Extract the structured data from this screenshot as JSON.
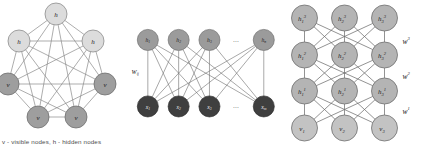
{
  "figure": {
    "caption": "v - visible nodes, h - hidden nodes"
  },
  "colors": {
    "hidden_light": "#dcdcdc",
    "visible_mid": "#9e9e9e",
    "rbm_hidden": "#9b9b9b",
    "rbm_visible": "#3f3f3f",
    "dbn_node": "#b4b4b4",
    "edge": "#8a8a8a",
    "background": "#ffffff",
    "text": "#1b1b1b"
  },
  "panels": {
    "boltzmann_machine": {
      "name": "boltzmann-machine",
      "nodes": [
        {
          "id": "h-top",
          "label": "h",
          "type": "hidden",
          "cx": 56,
          "cy": 14,
          "r": 11
        },
        {
          "id": "h-upper-left",
          "label": "h",
          "type": "hidden",
          "cx": 19,
          "cy": 41,
          "r": 11
        },
        {
          "id": "h-upper-right",
          "label": "h",
          "type": "hidden",
          "cx": 93,
          "cy": 41,
          "r": 11
        },
        {
          "id": "v-left",
          "label": "v",
          "type": "visible",
          "cx": 8,
          "cy": 84,
          "r": 11
        },
        {
          "id": "v-right",
          "label": "v",
          "type": "visible",
          "cx": 105,
          "cy": 84,
          "r": 11
        },
        {
          "id": "v-bottom-left",
          "label": "v",
          "type": "visible",
          "cx": 38,
          "cy": 117,
          "r": 11
        },
        {
          "id": "v-bottom-right",
          "label": "v",
          "type": "visible",
          "cx": 76,
          "cy": 117,
          "r": 11
        }
      ],
      "fully_connected": true,
      "edge_count": 21
    },
    "restricted_boltzmann_machine": {
      "name": "restricted-boltzmann-machine",
      "weight_label": "W",
      "weight_sub": "ij",
      "hidden_layer": {
        "labels": [
          "h",
          "h",
          "h",
          "h"
        ],
        "subs": [
          "1",
          "2",
          "3",
          "n"
        ],
        "ellipsis": "...",
        "cx": [
          22,
          60,
          98,
          165
        ],
        "cy": 32,
        "r": 13,
        "ellipsis_x": 131,
        "ellipsis_y": 32
      },
      "visible_layer": {
        "labels": [
          "x",
          "x",
          "x",
          "x"
        ],
        "subs": [
          "1",
          "2",
          "3",
          "m"
        ],
        "ellipsis": "...",
        "cx": [
          22,
          60,
          98,
          165
        ],
        "cy": 114,
        "r": 13,
        "ellipsis_x": 131,
        "ellipsis_y": 114
      }
    },
    "deep_belief_network": {
      "name": "deep-belief-network",
      "weights": [
        {
          "label": "w",
          "sup": "3",
          "x": 120,
          "y": 41
        },
        {
          "label": "w",
          "sup": "2",
          "x": 120,
          "y": 76
        },
        {
          "label": "w",
          "sup": "1",
          "x": 120,
          "y": 111
        }
      ],
      "layers": [
        {
          "id": "layer-h3",
          "cy": 18,
          "nodes": [
            {
              "label": "h",
              "sub": "1",
              "sup": "3",
              "cx": 22
            },
            {
              "label": "h",
              "sub": "2",
              "sup": "3",
              "cx": 62
            },
            {
              "label": "h",
              "sub": "3",
              "sup": "3",
              "cx": 102
            }
          ]
        },
        {
          "id": "layer-h2",
          "cy": 55,
          "nodes": [
            {
              "label": "h",
              "sub": "1",
              "sup": "2",
              "cx": 22
            },
            {
              "label": "h",
              "sub": "2",
              "sup": "2",
              "cx": 62
            },
            {
              "label": "h",
              "sub": "3",
              "sup": "2",
              "cx": 102
            }
          ]
        },
        {
          "id": "layer-h1",
          "cy": 91,
          "nodes": [
            {
              "label": "h",
              "sub": "1",
              "sup": "1",
              "cx": 22
            },
            {
              "label": "h",
              "sub": "2",
              "sup": "1",
              "cx": 62
            },
            {
              "label": "h",
              "sub": "3",
              "sup": "1",
              "cx": 102
            }
          ]
        },
        {
          "id": "layer-v",
          "cy": 128,
          "nodes": [
            {
              "label": "v",
              "sub": "1",
              "sup": "",
              "cx": 22
            },
            {
              "label": "v",
              "sub": "2",
              "sup": "",
              "cx": 62
            },
            {
              "label": "v",
              "sub": "3",
              "sup": "",
              "cx": 102
            }
          ]
        }
      ],
      "node_radius": 13
    }
  }
}
